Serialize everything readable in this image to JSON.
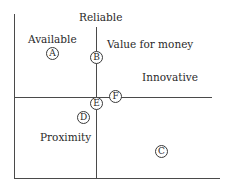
{
  "diagram": {
    "type": "positioning-map",
    "axes": {
      "vertical_top_label": "Reliable"
    },
    "region_labels": {
      "top_left": "Available",
      "top_right_upper": "Value for money",
      "top_right_lower": "Innovative",
      "bottom_left": "Proximity"
    },
    "markers": [
      {
        "id": "A",
        "label": "A"
      },
      {
        "id": "B",
        "label": "B"
      },
      {
        "id": "C",
        "label": "C"
      },
      {
        "id": "D",
        "label": "D"
      },
      {
        "id": "E",
        "label": "E"
      },
      {
        "id": "F",
        "label": "F"
      }
    ]
  }
}
